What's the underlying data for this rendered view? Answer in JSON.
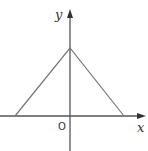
{
  "diagram": {
    "type": "function-graph",
    "axes": {
      "x_label": "x",
      "y_label": "y",
      "origin_label": "O"
    },
    "shape": {
      "kind": "triangle",
      "vertices_px": [
        [
          15,
          116
        ],
        [
          70,
          48
        ],
        [
          124,
          116
        ]
      ]
    },
    "colors": {
      "axes": "#555555",
      "graph": "#777777",
      "text": "#333333"
    }
  }
}
